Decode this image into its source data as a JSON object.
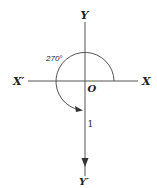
{
  "diagram": {
    "axis_labels": {
      "y_positive": "Y",
      "y_negative": "Y′",
      "x_positive": "X",
      "x_negative": "X′",
      "origin": "O"
    },
    "angle_label": "270°",
    "radius_label": "1",
    "colors": {
      "line": "#555555",
      "text": "#222222",
      "background": "#ffffff"
    }
  }
}
